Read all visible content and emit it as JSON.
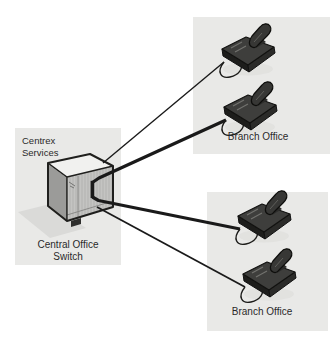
{
  "diagram": {
    "type": "network-topology",
    "colors": {
      "canvas_bg": "#ffffff",
      "region_fill": "#e9e9e7",
      "wire_color": "#1a1a1a",
      "text_color": "#2a2a2a",
      "phone_color": "#3e3e3c"
    },
    "regions": {
      "centrex": {
        "label": "Centrex\nServices",
        "caption": "Central Office\nSwitch"
      },
      "branch_top": {
        "label": "Branch Office"
      },
      "branch_bottom": {
        "label": "Branch Office"
      }
    },
    "nodes": [
      {
        "id": "central-office-switch",
        "kind": "switch-cabinet",
        "region": "centrex"
      },
      {
        "id": "branch-top-phone-1",
        "kind": "telephone",
        "region": "branch_top"
      },
      {
        "id": "branch-top-phone-2",
        "kind": "telephone",
        "region": "branch_top"
      },
      {
        "id": "branch-bottom-phone-1",
        "kind": "telephone",
        "region": "branch_bottom"
      },
      {
        "id": "branch-bottom-phone-2",
        "kind": "telephone",
        "region": "branch_bottom"
      }
    ],
    "connections": [
      {
        "from": "central-office-switch",
        "to": "branch-top-phone-1",
        "weight": "thin"
      },
      {
        "from": "central-office-switch",
        "to": "branch-top-phone-2",
        "weight": "thick"
      },
      {
        "from": "central-office-switch",
        "to": "branch-bottom-phone-1",
        "weight": "thick"
      },
      {
        "from": "central-office-switch",
        "to": "branch-bottom-phone-2",
        "weight": "thin"
      }
    ]
  }
}
